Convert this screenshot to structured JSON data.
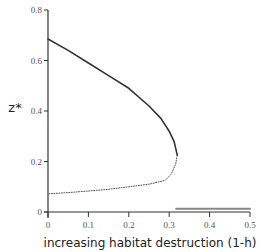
{
  "chart_data": {
    "type": "line",
    "title": "",
    "xlabel": "increasing habitat destruction (1-h)",
    "ylabel": "z*",
    "xlim": [
      0,
      0.5
    ],
    "ylim": [
      0,
      0.8
    ],
    "x_ticks": [
      0,
      0.1,
      0.2,
      0.3,
      0.4,
      0.5
    ],
    "x_tick_labels": [
      "0",
      "0.1",
      "0.2",
      "0.3",
      "0.4",
      "0.5"
    ],
    "y_ticks": [
      0,
      0.2,
      0.4,
      0.6,
      0.8
    ],
    "y_tick_labels": [
      "0",
      "0.2",
      "0.4",
      "0.6",
      "0.8"
    ],
    "grid": false,
    "legend": "none",
    "series": [
      {
        "name": "stable upper branch",
        "style": "solid",
        "color": "#333333",
        "points": [
          [
            0,
            0.685
          ],
          [
            0.05,
            0.64
          ],
          [
            0.1,
            0.59
          ],
          [
            0.15,
            0.54
          ],
          [
            0.2,
            0.49
          ],
          [
            0.25,
            0.42
          ],
          [
            0.28,
            0.37
          ],
          [
            0.3,
            0.32
          ],
          [
            0.312,
            0.28
          ],
          [
            0.317,
            0.245
          ],
          [
            0.32,
            0.225
          ]
        ]
      },
      {
        "name": "unstable lower branch",
        "style": "dotted",
        "color": "#555555",
        "points": [
          [
            0.32,
            0.225
          ],
          [
            0.316,
            0.19
          ],
          [
            0.305,
            0.15
          ],
          [
            0.29,
            0.125
          ],
          [
            0.25,
            0.11
          ],
          [
            0.2,
            0.1
          ],
          [
            0.15,
            0.09
          ],
          [
            0.1,
            0.083
          ],
          [
            0.05,
            0.077
          ],
          [
            0,
            0.072
          ]
        ]
      },
      {
        "name": "extinction branch",
        "style": "solid",
        "color": "#888888",
        "points": [
          [
            0.317,
            0.013
          ],
          [
            0.5,
            0.013
          ]
        ]
      }
    ]
  }
}
